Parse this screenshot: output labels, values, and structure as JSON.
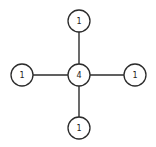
{
  "diagram": {
    "type": "star-graph",
    "nodes": [
      {
        "id": "center",
        "label": "4",
        "cx": 79,
        "cy": 75
      },
      {
        "id": "top",
        "label": "1",
        "cx": 79,
        "cy": 21
      },
      {
        "id": "left",
        "label": "1",
        "cx": 22,
        "cy": 75
      },
      {
        "id": "right",
        "label": "1",
        "cx": 135,
        "cy": 75
      },
      {
        "id": "bottom",
        "label": "1",
        "cx": 79,
        "cy": 128
      }
    ],
    "edges": [
      {
        "from": "center",
        "to": "top"
      },
      {
        "from": "center",
        "to": "left"
      },
      {
        "from": "center",
        "to": "right"
      },
      {
        "from": "center",
        "to": "bottom"
      }
    ],
    "node_radius": 11,
    "colors": {
      "stroke": "#2b2b2b",
      "fill": "#ffffff",
      "text": "#222222"
    }
  }
}
